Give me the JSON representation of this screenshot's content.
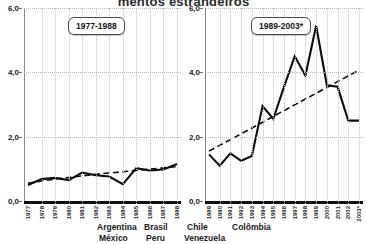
{
  "figure": {
    "title": "mentos estrangeiros"
  },
  "legend": {
    "row1": [
      "Argentina",
      "Brasil",
      "Chile",
      "Colômbia"
    ],
    "row2": [
      "México",
      "Peru",
      "Venezuela"
    ]
  },
  "panels": {
    "left": {
      "tag": "1977-1988"
    },
    "right": {
      "tag": "1989-2003*"
    }
  },
  "chart_data": [
    {
      "type": "line",
      "title": "1977-1988",
      "xlabel": "",
      "ylabel": "",
      "ylim": [
        0.0,
        6.0
      ],
      "yticks": [
        0.0,
        2.0,
        4.0,
        6.0
      ],
      "ytick_labels": [
        "0,0",
        "2,0",
        "4,0",
        "6,0"
      ],
      "grid": true,
      "legend_position": "below",
      "categories": [
        "1977",
        "1978",
        "1979",
        "1980",
        "1981",
        "1982",
        "1983",
        "1984",
        "1985",
        "1986",
        "1987",
        "1988"
      ],
      "series": [
        {
          "name": "Observado",
          "style": "solid",
          "values": [
            0.5,
            0.68,
            0.72,
            0.65,
            0.88,
            0.8,
            0.76,
            0.52,
            1.02,
            0.95,
            0.98,
            1.15
          ]
        },
        {
          "name": "Tendência",
          "style": "dashed",
          "values": [
            0.55,
            0.62,
            0.68,
            0.73,
            0.78,
            0.83,
            0.87,
            0.91,
            0.95,
            0.99,
            1.03,
            1.07
          ]
        }
      ]
    },
    {
      "type": "line",
      "title": "1989-2003*",
      "xlabel": "",
      "ylabel": "",
      "ylim": [
        0.0,
        6.0
      ],
      "yticks": [
        0.0,
        2.0,
        4.0,
        6.0
      ],
      "ytick_labels": [
        "0,0",
        "2,0",
        "4,0",
        "6,0"
      ],
      "grid": true,
      "legend_position": "below",
      "categories": [
        "1989",
        "1990",
        "1991",
        "1992",
        "1993",
        "1994",
        "1995",
        "1996",
        "1997",
        "1998",
        "1999",
        "2000",
        "2001",
        "2002",
        "2003*"
      ],
      "series": [
        {
          "name": "Observado",
          "style": "solid",
          "values": [
            1.45,
            1.1,
            1.48,
            1.25,
            1.4,
            2.95,
            2.55,
            3.55,
            4.5,
            3.9,
            5.45,
            3.6,
            3.55,
            2.5,
            2.5
          ]
        },
        {
          "name": "Tendência",
          "style": "dashed",
          "values": [
            1.55,
            1.73,
            1.91,
            2.09,
            2.27,
            2.45,
            2.63,
            2.81,
            2.99,
            3.17,
            3.35,
            3.53,
            3.71,
            3.89,
            4.07
          ]
        }
      ]
    }
  ]
}
